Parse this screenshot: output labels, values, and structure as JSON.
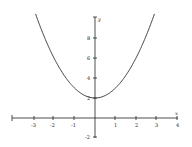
{
  "chart_data": {
    "type": "line",
    "title": "",
    "function": "y = x^2 + 2",
    "xlabel": "x",
    "ylabel": "y",
    "xlim": [
      -4,
      4
    ],
    "ylim": [
      -2,
      10
    ],
    "x_ticks": [
      -3,
      -2,
      -1,
      1,
      2,
      3,
      4
    ],
    "y_ticks": [
      -2,
      2,
      4,
      6,
      8
    ],
    "grid": false,
    "legend": null,
    "series": [
      {
        "name": "y = x^2 + 2",
        "x": [
          -2.9,
          -2.5,
          -2,
          -1.5,
          -1,
          -0.5,
          0,
          0.5,
          1,
          1.5,
          2,
          2.5,
          2.9
        ],
        "values": [
          10.41,
          8.25,
          6,
          4.25,
          3,
          2.25,
          2,
          2.25,
          3,
          4.25,
          6,
          8.25,
          10.41
        ]
      }
    ],
    "colors": {
      "axis": "#222222",
      "curve": "#333333",
      "background": "#ffffff"
    }
  },
  "labels": {
    "x_axis": "x",
    "y_axis": "y",
    "x_ticks": [
      "-3",
      "-2",
      "-1",
      "1",
      "2",
      "3",
      "4"
    ],
    "y_ticks": [
      "8",
      "6",
      "4",
      "2",
      "-2"
    ]
  }
}
